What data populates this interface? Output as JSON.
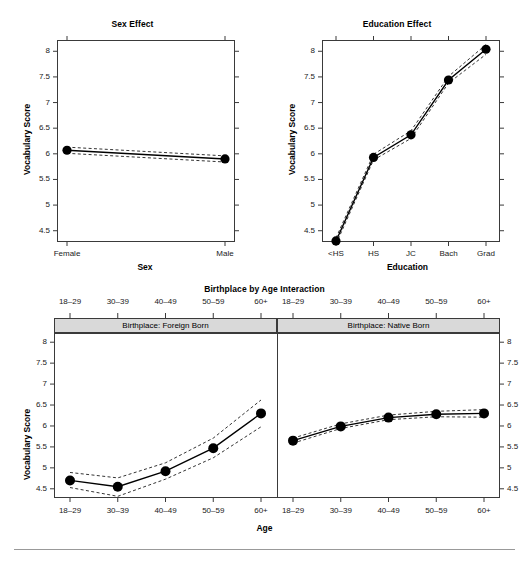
{
  "figure": {
    "background": "#ffffff",
    "rule_color": "#999999",
    "strip_fill": "#d9d9d9",
    "axis_color": "#3a3a3a",
    "line_color": "#000000"
  },
  "panels": {
    "sex": {
      "title": "Sex Effect",
      "xlabel": "Sex",
      "ylabel": "Vocabulary Score"
    },
    "education": {
      "title": "Education Effect",
      "xlabel": "Education",
      "ylabel": "Vocabulary Score"
    },
    "interaction": {
      "title": "Birthplace by Age Interaction",
      "xlabel": "Age",
      "ylabel": "Vocabulary Score",
      "strip_left": "Birthplace: Foreign Born",
      "strip_right": "Birthplace: Native Born"
    }
  },
  "yticks": [
    "4.5",
    "5",
    "5.5",
    "6",
    "6.5",
    "7",
    "7.5",
    "8"
  ],
  "chart_data": [
    {
      "type": "line",
      "title": "Sex Effect",
      "xlabel": "Sex",
      "ylabel": "Vocabulary Score",
      "categories": [
        "Female",
        "Male"
      ],
      "values": [
        6.07,
        5.9
      ],
      "ci_lower": [
        6.01,
        5.84
      ],
      "ci_upper": [
        6.13,
        5.96
      ],
      "ylim": [
        4.28,
        8.22
      ],
      "yticks": [
        4.5,
        5,
        5.5,
        6,
        6.5,
        7,
        7.5,
        8
      ],
      "grid": false,
      "legend": "none",
      "markers": "filled-circle",
      "ci_style": "dashed"
    },
    {
      "type": "line",
      "title": "Education Effect",
      "xlabel": "Education",
      "ylabel": "Vocabulary Score",
      "categories": [
        "<HS",
        "HS",
        "JC",
        "Bach",
        "Grad"
      ],
      "values": [
        4.3,
        5.93,
        6.37,
        7.44,
        8.04
      ],
      "ci_lower": [
        4.24,
        5.88,
        6.3,
        7.38,
        7.94
      ],
      "ci_upper": [
        4.36,
        5.99,
        6.45,
        7.51,
        8.13
      ],
      "ylim": [
        4.28,
        8.22
      ],
      "yticks": [
        4.5,
        5,
        5.5,
        6,
        6.5,
        7,
        7.5,
        8
      ],
      "grid": false,
      "legend": "none",
      "markers": "filled-circle",
      "ci_style": "dashed"
    },
    {
      "type": "line",
      "title": "Birthplace by Age Interaction",
      "xlabel": "Age",
      "ylabel": "Vocabulary Score",
      "categories": [
        "18–29",
        "30–39",
        "40–49",
        "50–59",
        "60+"
      ],
      "ylim": [
        4.28,
        8.22
      ],
      "yticks": [
        4.5,
        5,
        5.5,
        6,
        6.5,
        7,
        7.5,
        8
      ],
      "grid": false,
      "legend": "none",
      "markers": "filled-circle",
      "ci_style": "dashed",
      "panel_variable": "Birthplace",
      "series": [
        {
          "name": "Birthplace: Foreign Born",
          "values": [
            4.7,
            4.55,
            4.92,
            5.47,
            6.3
          ],
          "ci_lower": [
            4.53,
            4.32,
            4.73,
            5.24,
            5.98
          ],
          "ci_upper": [
            4.89,
            4.76,
            5.12,
            5.71,
            6.62
          ]
        },
        {
          "name": "Birthplace: Native Born",
          "values": [
            5.65,
            5.99,
            6.2,
            6.28,
            6.3
          ],
          "ci_lower": [
            5.59,
            5.94,
            6.15,
            6.22,
            6.21
          ],
          "ci_upper": [
            5.71,
            6.05,
            6.26,
            6.35,
            6.39
          ]
        }
      ]
    }
  ]
}
